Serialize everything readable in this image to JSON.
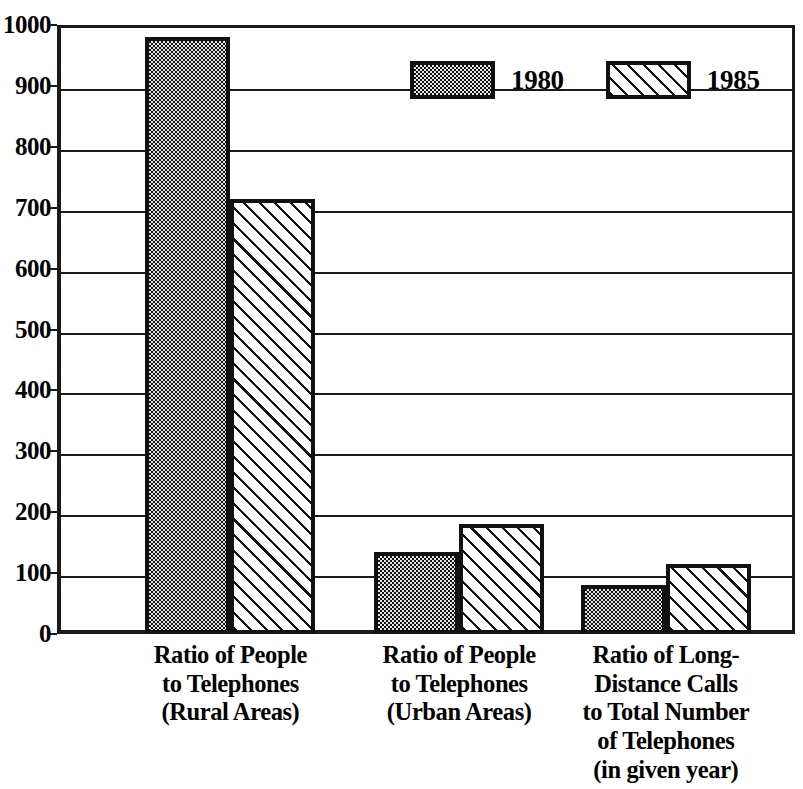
{
  "chart_data": {
    "type": "bar",
    "title": "",
    "subtitle": "",
    "xlabel": "",
    "ylabel": "",
    "ylim": [
      0,
      1000
    ],
    "y_ticks": [
      0,
      100,
      200,
      300,
      400,
      500,
      600,
      700,
      800,
      900,
      1000
    ],
    "y_tick_labels": [
      "0",
      "100",
      "200",
      "300",
      "400",
      "500",
      "600",
      "700",
      "800",
      "900",
      "1000"
    ],
    "grid": "horizontal",
    "legend_position": "top-center",
    "categories": [
      "Ratio of People to Telephones (Rural Areas)",
      "Ratio of People to Telephones (Urban Areas)",
      "Ratio of Long-Distance Calls to Total Number of Telephones (in given year)"
    ],
    "category_label_lines": [
      [
        "Ratio of People",
        "to Telephones",
        "(Rural Areas)"
      ],
      [
        "Ratio of People",
        "to Telephones",
        "(Urban Areas)"
      ],
      [
        "Ratio of Long-",
        "Distance Calls",
        "to Total Number",
        "of Telephones",
        "(in given year)"
      ]
    ],
    "series": [
      {
        "name": "1980",
        "fill": "dots",
        "values": [
          980,
          135,
          80
        ]
      },
      {
        "name": "1985",
        "fill": "hatch",
        "values": [
          715,
          180,
          115
        ]
      }
    ]
  },
  "legend": {
    "items": [
      {
        "label": "1980",
        "fill": "dots"
      },
      {
        "label": "1985",
        "fill": "hatch"
      }
    ]
  },
  "colors": {
    "ink": "#111111",
    "background": "#ffffff",
    "dot_fill_base": "#e6e6e6"
  }
}
